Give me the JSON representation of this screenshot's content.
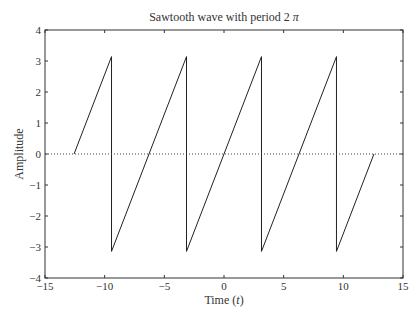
{
  "chart_data": {
    "type": "line",
    "xlabel": "Time (t)",
    "ylabel": "Amplitude",
    "xlim": [
      -15,
      15
    ],
    "ylim": [
      -4,
      4
    ],
    "xticks": [
      -15,
      -10,
      -5,
      0,
      5,
      10,
      15
    ],
    "xtick_labels": [
      "−15",
      "−10",
      "−5",
      "0",
      "5",
      "10",
      "15"
    ],
    "yticks": [
      -4,
      -3,
      -2,
      -1,
      0,
      1,
      2,
      3,
      4
    ],
    "ytick_labels": [
      "−4",
      "−3",
      "−2",
      "−1",
      "0",
      "1",
      "2",
      "3",
      "4"
    ],
    "grid": false,
    "series": [
      {
        "name": "sawtooth",
        "style": "solid",
        "x": [
          -12.566,
          -9.425,
          -9.425,
          -3.142,
          -3.142,
          3.142,
          3.142,
          9.425,
          9.425,
          12.566
        ],
        "y": [
          0,
          3.1416,
          -3.1416,
          3.1416,
          -3.1416,
          3.1416,
          -3.1416,
          3.1416,
          -3.1416,
          0
        ]
      },
      {
        "name": "zero-line",
        "style": "dotted",
        "x": [
          -15,
          15
        ],
        "y": [
          0,
          0
        ]
      }
    ]
  },
  "title_main": "Sawtooth wave with period 2",
  "title_symbol": "π",
  "xlabel_main": "Time (",
  "xlabel_var": "t",
  "xlabel_end": ")",
  "ylabel": "Amplitude"
}
